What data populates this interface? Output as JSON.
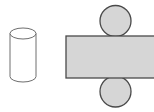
{
  "figure": {
    "width": 154,
    "height": 112,
    "background_color": "#ffffff",
    "palette": {
      "shape_fill_gray": "#d6d6d6",
      "shape_fill_white": "#ffffff",
      "outline_dark": "#4a4a4a",
      "outline_mid": "#6e6e6e",
      "background": "#ffffff"
    },
    "shapes": [
      {
        "id": "cylinder",
        "name": "cylinder",
        "label": "Cylinder",
        "fill": "#ffffff",
        "stroke": "#6e6e6e",
        "stroke_width": 1,
        "x": 10,
        "y": 28,
        "width": 26,
        "height": 54,
        "ellipse_rx": 13,
        "ellipse_ry": 5.5
      },
      {
        "id": "circle-top",
        "name": "circle",
        "label": "Top circle",
        "fill": "#d6d6d6",
        "stroke": "#4a4a4a",
        "stroke_width": 1.3,
        "cx": 115.5,
        "cy": 21,
        "r": 15.5
      },
      {
        "id": "rectangle-bar",
        "name": "rectangle",
        "label": "Rectangle bar",
        "fill": "#d6d6d6",
        "stroke": "#4a4a4a",
        "stroke_width": 1.3,
        "x": 66,
        "y": 36,
        "width": 92,
        "height": 42,
        "clipped_right_edge": true
      },
      {
        "id": "circle-bottom",
        "name": "circle",
        "label": "Bottom circle",
        "fill": "#d6d6d6",
        "stroke": "#4a4a4a",
        "stroke_width": 1.3,
        "cx": 115.5,
        "cy": 91.5,
        "r": 15.5
      }
    ]
  }
}
